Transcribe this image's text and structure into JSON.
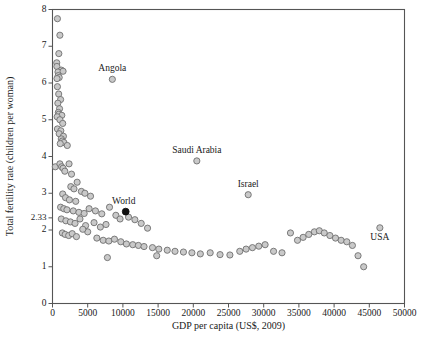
{
  "chart_data": {
    "type": "scatter",
    "title": "",
    "xlabel": "GDP per capita (US$, 2009)",
    "ylabel": "Total fertility rate (children per woman)",
    "xlim": [
      0,
      50000
    ],
    "ylim": [
      0,
      8
    ],
    "xticks": [
      0,
      5000,
      10000,
      15000,
      20000,
      25000,
      30000,
      35000,
      40000,
      45000,
      50000
    ],
    "xticklabels": [
      "0",
      "5000",
      "10000",
      "15000",
      "20000",
      "25000",
      "30000",
      "35000",
      "40000",
      "45000",
      "50000"
    ],
    "yticks": [
      0,
      1,
      2,
      2.33,
      3,
      4,
      5,
      6,
      7,
      8
    ],
    "yticklabels": [
      "0",
      "1",
      "2",
      "2.33",
      "3",
      "4",
      "5",
      "6",
      "7",
      "8"
    ],
    "grid": false,
    "legend": null,
    "marker": {
      "shape": "circle",
      "radius_px": 3.1,
      "fill": "#c9c9c9",
      "stroke": "#6f6f6f"
    },
    "highlight_marker": {
      "shape": "circle",
      "radius_px": 3.4,
      "fill": "#111111",
      "stroke": "#111111"
    },
    "annotations": [
      {
        "label": "Angola",
        "x": 8500,
        "y": 6.1,
        "label_dx": 0,
        "label_dy": -8
      },
      {
        "label": "Saudi Arabia",
        "x": 20500,
        "y": 3.88,
        "label_dx": 0,
        "label_dy": -8
      },
      {
        "label": "Israel",
        "x": 27800,
        "y": 2.96,
        "label_dx": 0,
        "label_dy": -8
      },
      {
        "label": "World",
        "x": 10400,
        "y": 2.5,
        "label_dx": -2,
        "label_dy": -8
      },
      {
        "label": "USA",
        "x": 46500,
        "y": 2.06,
        "label_dx": 0,
        "label_dy": 12
      }
    ],
    "highlight_points": [
      {
        "name": "World",
        "x": 10400,
        "y": 2.5
      }
    ],
    "points": [
      [
        700,
        7.75
      ],
      [
        1050,
        7.3
      ],
      [
        900,
        6.8
      ],
      [
        600,
        6.55
      ],
      [
        620,
        6.45
      ],
      [
        1250,
        6.35
      ],
      [
        780,
        6.3
      ],
      [
        1500,
        6.32
      ],
      [
        820,
        6.2
      ],
      [
        950,
        6.15
      ],
      [
        640,
        6.12
      ],
      [
        8500,
        6.1
      ],
      [
        700,
        5.9
      ],
      [
        880,
        5.7
      ],
      [
        1150,
        5.55
      ],
      [
        760,
        5.45
      ],
      [
        1000,
        5.3
      ],
      [
        830,
        5.2
      ],
      [
        900,
        5.15
      ],
      [
        1320,
        5.12
      ],
      [
        660,
        5.08
      ],
      [
        1050,
        5.0
      ],
      [
        1450,
        4.9
      ],
      [
        700,
        4.75
      ],
      [
        1180,
        4.7
      ],
      [
        950,
        4.62
      ],
      [
        1550,
        4.55
      ],
      [
        1250,
        4.48
      ],
      [
        1400,
        4.42
      ],
      [
        1620,
        4.38
      ],
      [
        1100,
        4.35
      ],
      [
        2100,
        4.3
      ],
      [
        400,
        3.72
      ],
      [
        1050,
        3.8
      ],
      [
        1300,
        3.72
      ],
      [
        1500,
        3.68
      ],
      [
        2350,
        3.8
      ],
      [
        1750,
        3.6
      ],
      [
        2700,
        3.52
      ],
      [
        3500,
        3.3
      ],
      [
        20500,
        3.88
      ],
      [
        2600,
        3.18
      ],
      [
        3050,
        3.12
      ],
      [
        4100,
        3.05
      ],
      [
        4600,
        3.0
      ],
      [
        1450,
        2.98
      ],
      [
        5400,
        2.92
      ],
      [
        1850,
        2.88
      ],
      [
        2400,
        2.82
      ],
      [
        3300,
        2.78
      ],
      [
        27800,
        2.96
      ],
      [
        1150,
        2.62
      ],
      [
        1600,
        2.58
      ],
      [
        2050,
        2.55
      ],
      [
        2950,
        2.52
      ],
      [
        3750,
        2.48
      ],
      [
        4500,
        2.45
      ],
      [
        5200,
        2.58
      ],
      [
        6100,
        2.52
      ],
      [
        7000,
        2.44
      ],
      [
        8100,
        2.62
      ],
      [
        9000,
        2.4
      ],
      [
        9600,
        2.3
      ],
      [
        10800,
        2.35
      ],
      [
        11700,
        2.28
      ],
      [
        1250,
        2.3
      ],
      [
        1900,
        2.25
      ],
      [
        2550,
        2.22
      ],
      [
        3200,
        2.18
      ],
      [
        3900,
        2.3
      ],
      [
        4700,
        2.12
      ],
      [
        5900,
        2.2
      ],
      [
        6800,
        2.08
      ],
      [
        7600,
        2.15
      ],
      [
        12600,
        2.18
      ],
      [
        13500,
        2.05
      ],
      [
        1400,
        1.92
      ],
      [
        1800,
        1.88
      ],
      [
        2300,
        1.85
      ],
      [
        2800,
        1.9
      ],
      [
        3400,
        1.82
      ],
      [
        6300,
        1.78
      ],
      [
        7200,
        1.72
      ],
      [
        8000,
        1.7
      ],
      [
        8800,
        1.75
      ],
      [
        9700,
        1.68
      ],
      [
        10500,
        1.62
      ],
      [
        11400,
        1.6
      ],
      [
        12200,
        1.58
      ],
      [
        13000,
        1.55
      ],
      [
        14200,
        1.52
      ],
      [
        15100,
        1.48
      ],
      [
        16300,
        1.45
      ],
      [
        17400,
        1.42
      ],
      [
        18600,
        1.4
      ],
      [
        19800,
        1.38
      ],
      [
        21000,
        1.35
      ],
      [
        22400,
        1.38
      ],
      [
        23800,
        1.33
      ],
      [
        25200,
        1.32
      ],
      [
        26600,
        1.42
      ],
      [
        27500,
        1.48
      ],
      [
        28400,
        1.52
      ],
      [
        29300,
        1.56
      ],
      [
        30200,
        1.6
      ],
      [
        31400,
        1.42
      ],
      [
        32600,
        1.38
      ],
      [
        33800,
        1.92
      ],
      [
        34800,
        1.72
      ],
      [
        35600,
        1.8
      ],
      [
        36400,
        1.88
      ],
      [
        37200,
        1.95
      ],
      [
        37900,
        1.98
      ],
      [
        38600,
        1.92
      ],
      [
        39400,
        1.85
      ],
      [
        40200,
        1.78
      ],
      [
        41000,
        1.72
      ],
      [
        41800,
        1.68
      ],
      [
        42600,
        1.58
      ],
      [
        43400,
        1.3
      ],
      [
        44200,
        1.0
      ],
      [
        46500,
        2.06
      ],
      [
        7800,
        1.25
      ],
      [
        14800,
        1.3
      ],
      [
        5000,
        1.95
      ],
      [
        4300,
        2.02
      ]
    ]
  }
}
